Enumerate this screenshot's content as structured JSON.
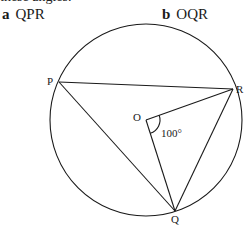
{
  "header": {
    "clipped_line": "these angles."
  },
  "questions": [
    {
      "letter": "a",
      "label": "QPR"
    },
    {
      "letter": "b",
      "label": "OQR"
    }
  ],
  "diagram": {
    "circle": {
      "cx": 146,
      "cy": 120,
      "r": 96
    },
    "points": {
      "P": {
        "x": 59,
        "y": 82,
        "label": "P"
      },
      "R": {
        "x": 233,
        "y": 89,
        "label": "R"
      },
      "Q": {
        "x": 175,
        "y": 211,
        "label": "Q"
      },
      "O": {
        "x": 146,
        "y": 120,
        "label": "O"
      }
    },
    "segments": [
      "PR",
      "PQ",
      "OR",
      "OQ",
      "RQ"
    ],
    "angle": {
      "at": "O",
      "between": [
        "R",
        "Q"
      ],
      "value": "100°"
    },
    "stroke_color": "#1a1a1a"
  }
}
